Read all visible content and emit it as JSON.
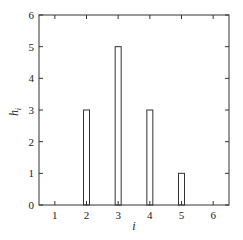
{
  "chart_data": {
    "type": "bar",
    "title": "",
    "xlabel": "i",
    "ylabel": "h_i",
    "ylabel_main": "h",
    "ylabel_sub": "i",
    "categories": [
      1,
      2,
      3,
      4,
      5,
      6
    ],
    "values": [
      0,
      3,
      5,
      3,
      1,
      0
    ],
    "xlim": [
      0.5,
      6.5
    ],
    "ylim": [
      0,
      6
    ],
    "xticks": [
      1,
      2,
      3,
      4,
      5,
      6
    ],
    "yticks": [
      0,
      1,
      2,
      3,
      4,
      5,
      6
    ],
    "grid": false,
    "legend": null,
    "bar_style": "outline",
    "colors": {
      "stroke": "#333333",
      "fill": "#ffffff",
      "frame": "#333333"
    }
  }
}
